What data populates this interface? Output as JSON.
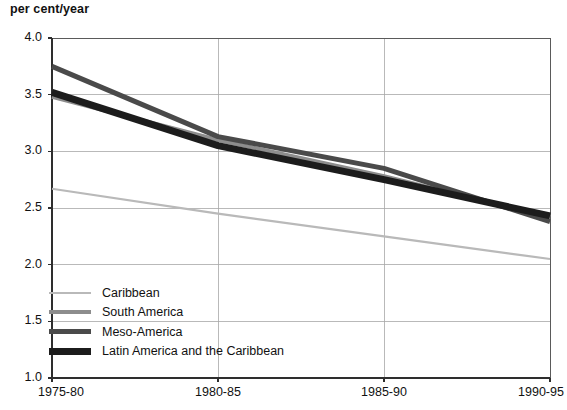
{
  "chart_data": {
    "type": "line",
    "title": "",
    "subtitle": "",
    "ylabel": "per cent/year",
    "xlabel": "",
    "categories": [
      "1975-80",
      "1980-85",
      "1985-90",
      "1990-95"
    ],
    "ylim": [
      1.0,
      4.0
    ],
    "yticks": [
      "1.0",
      "1.5",
      "2.0",
      "2.5",
      "3.0",
      "3.5",
      "4.0"
    ],
    "ytick_values": [
      1.0,
      1.5,
      2.0,
      2.5,
      3.0,
      3.5,
      4.0
    ],
    "grid": "both",
    "legend_position": "lower-left-inside",
    "series": [
      {
        "name": "Caribbean",
        "values": [
          2.67,
          2.45,
          2.25,
          2.05
        ],
        "color": "#b9b9b9",
        "width": 2.2
      },
      {
        "name": "South America",
        "values": [
          3.48,
          3.1,
          2.78,
          2.42
        ],
        "color": "#8d8d8d",
        "width": 4.0
      },
      {
        "name": "Meso-America",
        "values": [
          3.75,
          3.13,
          2.85,
          2.38
        ],
        "color": "#4a4a4a",
        "width": 5.0
      },
      {
        "name": "Latin America and the Caribbean",
        "values": [
          3.52,
          3.05,
          2.75,
          2.43
        ],
        "color": "#1c1c1c",
        "width": 7.0
      }
    ]
  },
  "legend": {
    "items": [
      {
        "label": "Caribbean"
      },
      {
        "label": "South America"
      },
      {
        "label": "Meso-America"
      },
      {
        "label": "Latin America and the Caribbean"
      }
    ]
  }
}
